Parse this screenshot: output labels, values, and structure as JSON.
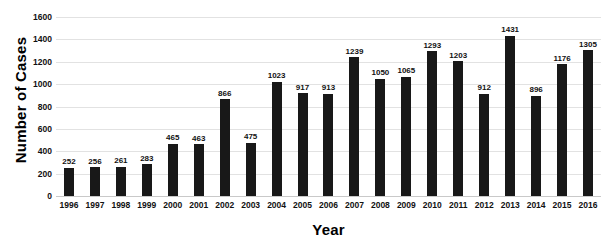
{
  "chart_data": {
    "type": "bar",
    "title": "",
    "xlabel": "Year",
    "ylabel": "Number of Cases",
    "categories": [
      "1996",
      "1997",
      "1998",
      "1999",
      "2000",
      "2001",
      "2002",
      "2003",
      "2004",
      "2005",
      "2006",
      "2007",
      "2008",
      "2009",
      "2010",
      "2011",
      "2012",
      "2013",
      "2014",
      "2015",
      "2016"
    ],
    "values": [
      252,
      256,
      261,
      283,
      465,
      463,
      866,
      475,
      1023,
      917,
      913,
      1239,
      1050,
      1065,
      1293,
      1203,
      912,
      1431,
      896,
      1176,
      1305
    ],
    "ylim": [
      0,
      1600
    ],
    "ytick_step": 200,
    "yticks": [
      "1600",
      "1400",
      "1200",
      "1000",
      "800",
      "600",
      "400",
      "200",
      "0"
    ],
    "grid": true,
    "legend": false,
    "data_labels": true,
    "bar_color": "#181818",
    "gridline_color": "#e2e2e2"
  },
  "axes": {
    "y_title": "Number of Cases",
    "x_title": "Year"
  },
  "clipped_title_fragment": ""
}
